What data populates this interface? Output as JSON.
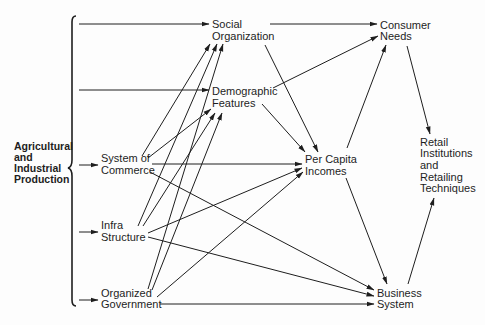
{
  "diagram": {
    "nodes": {
      "agri": {
        "lines": [
          "Agricultural",
          "and",
          "Industrial",
          "Production"
        ]
      },
      "social_org": {
        "lines": [
          "Social",
          "Organization"
        ]
      },
      "demographic": {
        "lines": [
          "Demographic",
          "Features"
        ]
      },
      "commerce": {
        "lines": [
          "System of",
          "Commerce"
        ]
      },
      "infra": {
        "lines": [
          "Infra",
          "Structure"
        ]
      },
      "govt": {
        "lines": [
          "Organized",
          "Government"
        ]
      },
      "per_capita": {
        "lines": [
          "Per Capita",
          "Incomes"
        ]
      },
      "consumer": {
        "lines": [
          "Consumer",
          "Needs"
        ]
      },
      "business": {
        "lines": [
          "Business",
          "System"
        ]
      },
      "retail": {
        "lines": [
          "Retail",
          "Institutions",
          "and",
          "Retailing",
          "Techniques"
        ]
      }
    },
    "edges": [
      {
        "from": "agri",
        "to": "social_org"
      },
      {
        "from": "agri",
        "to": "demographic"
      },
      {
        "from": "agri",
        "to": "commerce"
      },
      {
        "from": "agri",
        "to": "infra"
      },
      {
        "from": "agri",
        "to": "govt"
      },
      {
        "from": "social_org",
        "to": "consumer"
      },
      {
        "from": "demographic",
        "to": "consumer"
      },
      {
        "from": "social_org",
        "to": "per_capita"
      },
      {
        "from": "demographic",
        "to": "per_capita"
      },
      {
        "from": "per_capita",
        "to": "consumer"
      },
      {
        "from": "consumer",
        "to": "retail"
      },
      {
        "from": "per_capita",
        "to": "business"
      },
      {
        "from": "business",
        "to": "retail"
      },
      {
        "from": "commerce",
        "to": "per_capita"
      },
      {
        "from": "commerce",
        "to": "business"
      },
      {
        "from": "infra",
        "to": "per_capita"
      },
      {
        "from": "infra",
        "to": "business"
      },
      {
        "from": "govt",
        "to": "per_capita"
      },
      {
        "from": "govt",
        "to": "business"
      },
      {
        "from": "commerce",
        "to": "social_org"
      },
      {
        "from": "commerce",
        "to": "demographic"
      },
      {
        "from": "infra",
        "to": "social_org"
      },
      {
        "from": "infra",
        "to": "demographic"
      },
      {
        "from": "govt",
        "to": "social_org"
      },
      {
        "from": "govt",
        "to": "demographic"
      }
    ]
  }
}
